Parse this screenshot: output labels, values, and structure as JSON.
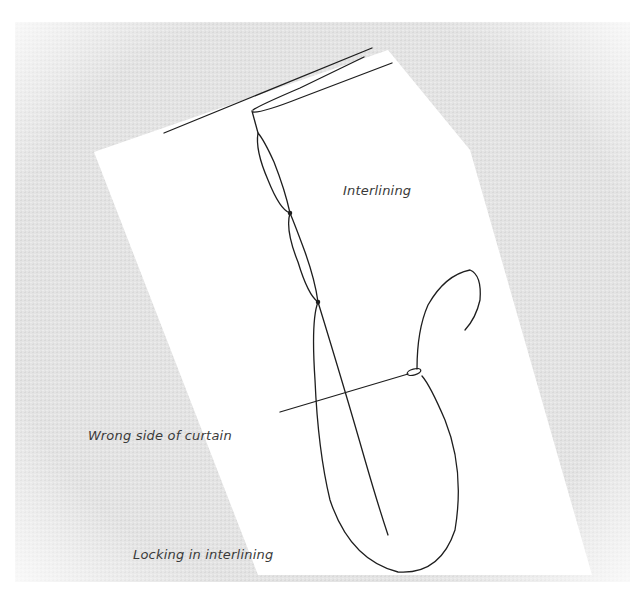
{
  "diagram": {
    "type": "sewing-illustration",
    "labels": {
      "interlining": "Interlining",
      "wrong_side": "Wrong side of curtain",
      "caption": "Locking in interlining"
    },
    "colors": {
      "fabric_background": "#e6e6e6",
      "interlining_panel": "#ffffff",
      "thread": "#1e1e1e",
      "label_text": "#3a3a3a"
    }
  }
}
